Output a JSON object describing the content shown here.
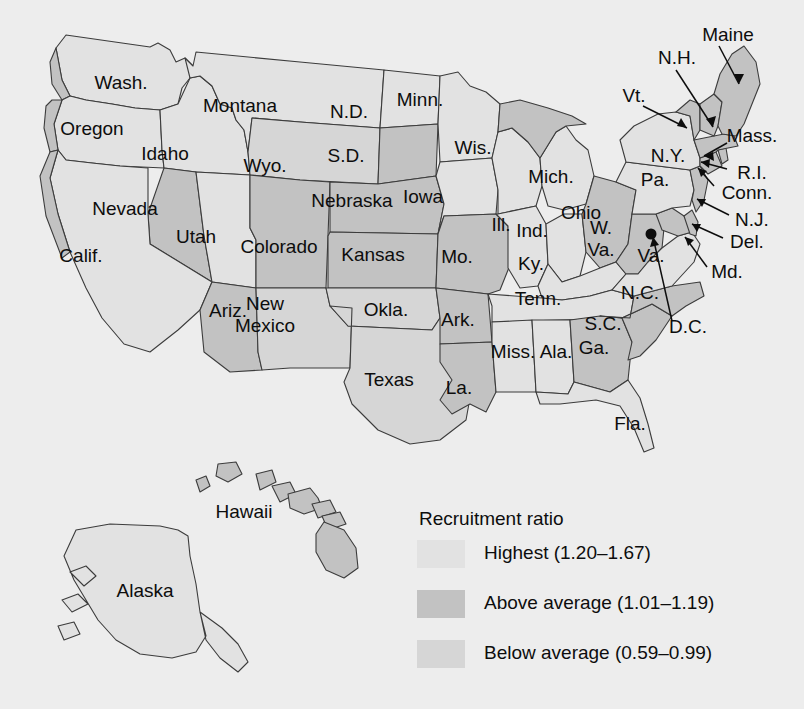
{
  "figure": {
    "type": "choropleth-map"
  },
  "legend": {
    "title": "Recruitment ratio",
    "entries": [
      {
        "label": "Highest (1.20–1.67)",
        "color": "#e2e2e2",
        "key": "high"
      },
      {
        "label": "Above average (1.01–1.19)",
        "color": "#c2c2c2",
        "key": "above"
      },
      {
        "label": "Below average (0.59–0.99)",
        "color": "#d6d6d6",
        "key": "below"
      }
    ]
  },
  "map_data": {
    "type": "choropleth",
    "categories": [
      "Highest (1.20–1.67)",
      "Above average (1.01–1.19)",
      "Below average (0.59–0.99)"
    ],
    "regions": [
      {
        "name": "Wash.",
        "class": "high"
      },
      {
        "name": "Oregon",
        "class": "high"
      },
      {
        "name": "Idaho",
        "class": "high"
      },
      {
        "name": "Montana",
        "class": "high"
      },
      {
        "name": "Wyo.",
        "class": "below"
      },
      {
        "name": "Nevada",
        "class": "above"
      },
      {
        "name": "Calif.",
        "class": "high"
      },
      {
        "name": "Utah",
        "class": "high"
      },
      {
        "name": "Colorado",
        "class": "above"
      },
      {
        "name": "Ariz.",
        "class": "above"
      },
      {
        "name": "New Mexico",
        "class": "below"
      },
      {
        "name": "N.D.",
        "class": "high"
      },
      {
        "name": "S.D.",
        "class": "above"
      },
      {
        "name": "Nebraska",
        "class": "above"
      },
      {
        "name": "Kansas",
        "class": "above"
      },
      {
        "name": "Okla.",
        "class": "below"
      },
      {
        "name": "Texas",
        "class": "below"
      },
      {
        "name": "Minn.",
        "class": "high"
      },
      {
        "name": "Iowa",
        "class": "high"
      },
      {
        "name": "Mo.",
        "class": "above"
      },
      {
        "name": "Ark.",
        "class": "above"
      },
      {
        "name": "La.",
        "class": "above"
      },
      {
        "name": "Wis.",
        "class": "high"
      },
      {
        "name": "Ill.",
        "class": "high"
      },
      {
        "name": "Mich.",
        "class": "high"
      },
      {
        "name": "Ind.",
        "class": "high"
      },
      {
        "name": "Ohio",
        "class": "above"
      },
      {
        "name": "Ky.",
        "class": "high"
      },
      {
        "name": "Tenn.",
        "class": "high"
      },
      {
        "name": "Miss.",
        "class": "high"
      },
      {
        "name": "Ala.",
        "class": "high"
      },
      {
        "name": "Ga.",
        "class": "above"
      },
      {
        "name": "Fla.",
        "class": "high"
      },
      {
        "name": "S.C.",
        "class": "above"
      },
      {
        "name": "N.C.",
        "class": "above"
      },
      {
        "name": "W. Va.",
        "class": "above"
      },
      {
        "name": "Va.",
        "class": "high"
      },
      {
        "name": "Md.",
        "class": "above"
      },
      {
        "name": "Del.",
        "class": "above"
      },
      {
        "name": "Pa.",
        "class": "high"
      },
      {
        "name": "N.J.",
        "class": "above"
      },
      {
        "name": "N.Y.",
        "class": "high"
      },
      {
        "name": "Conn.",
        "class": "above"
      },
      {
        "name": "R.I.",
        "class": "above"
      },
      {
        "name": "Mass.",
        "class": "above"
      },
      {
        "name": "Vt.",
        "class": "above"
      },
      {
        "name": "N.H.",
        "class": "above"
      },
      {
        "name": "Maine",
        "class": "above"
      },
      {
        "name": "Alaska",
        "class": "high"
      },
      {
        "name": "Hawaii",
        "class": "above"
      },
      {
        "name": "D.C.",
        "class": "point-marker"
      }
    ]
  },
  "labels": {
    "wash": "Wash.",
    "oregon": "Oregon",
    "idaho": "Idaho",
    "montana": "Montana",
    "wyo": "Wyo.",
    "nevada": "Nevada",
    "calif": "Calif.",
    "utah": "Utah",
    "colorado": "Colorado",
    "ariz": "Ariz.",
    "newmexico_line1": "New",
    "newmexico_line2": "Mexico",
    "nd": "N.D.",
    "sd": "S.D.",
    "nebraska": "Nebraska",
    "kansas": "Kansas",
    "okla": "Okla.",
    "texas": "Texas",
    "minn": "Minn.",
    "iowa": "Iowa",
    "mo": "Mo.",
    "ark": "Ark.",
    "la": "La.",
    "wis": "Wis.",
    "ill": "Ill.",
    "mich": "Mich.",
    "ind": "Ind.",
    "ohio": "Ohio",
    "ky": "Ky.",
    "tenn": "Tenn.",
    "miss": "Miss.",
    "ala": "Ala.",
    "ga": "Ga.",
    "fla": "Fla.",
    "sc": "S.C.",
    "nc": "N.C.",
    "wva_line1": "W.",
    "wva_line2": "Va.",
    "va": "Va.",
    "md": "Md.",
    "del": "Del.",
    "pa": "Pa.",
    "nj": "N.J.",
    "ny": "N.Y.",
    "conn": "Conn.",
    "ri": "R.I.",
    "mass": "Mass.",
    "vt": "Vt.",
    "nh": "N.H.",
    "maine": "Maine",
    "dc": "D.C.",
    "alaska": "Alaska",
    "hawaii": "Hawaii"
  }
}
